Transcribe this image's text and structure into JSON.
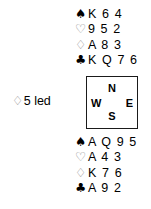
{
  "diagram": {
    "type": "bridge-hand-diagram",
    "background_color": "#ffffff",
    "text_color": "#000000",
    "outline_suit_color": "#7d7d7d"
  },
  "suits": {
    "spade": {
      "symbol": "♠",
      "name": "spade-symbol",
      "style": "filled"
    },
    "heart": {
      "symbol": "♡",
      "name": "heart-symbol",
      "style": "outline"
    },
    "diamond": {
      "symbol": "♢",
      "name": "diamond-symbol",
      "style": "outline"
    },
    "club": {
      "symbol": "♣",
      "name": "club-symbol",
      "style": "filled"
    }
  },
  "north_hand": {
    "position_label": "North",
    "spades": "K 6 4",
    "hearts": "9 5 2",
    "diamonds": "A 8 3",
    "clubs": "K Q 7 6"
  },
  "south_hand": {
    "position_label": "South",
    "spades": "A Q 9 5",
    "hearts": "A 4 3",
    "diamonds": "K 7 6",
    "clubs": "A 9 2"
  },
  "compass": {
    "north": "N",
    "west": "W",
    "east": "E",
    "south": "S",
    "border_color": "#1a1a1a"
  },
  "lead": {
    "suit_symbol": "♢",
    "text": "5 led",
    "full": "♢5 led"
  }
}
